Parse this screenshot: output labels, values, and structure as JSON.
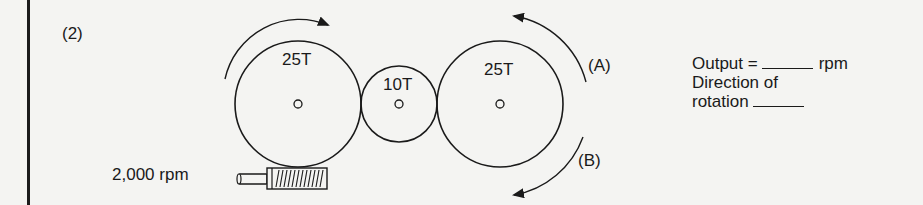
{
  "problem": {
    "number": "(2)"
  },
  "gears": [
    {
      "id": "input-gear",
      "teeth": "25T"
    },
    {
      "id": "idler-gear",
      "teeth": "10T"
    },
    {
      "id": "output-gear",
      "teeth": "25T"
    }
  ],
  "worm": {
    "input_speed": "2,000 rpm"
  },
  "directions": {
    "a_label": "(A)",
    "b_label": "(B)"
  },
  "answer": {
    "output_prefix": "Output =",
    "output_unit": "rpm",
    "direction_line1": "Direction of",
    "direction_line2": "rotation"
  }
}
